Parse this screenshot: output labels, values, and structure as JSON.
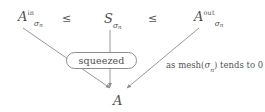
{
  "diagram": {
    "type": "squeeze-theorem-convergence",
    "top_row": {
      "left_term": {
        "base": "A",
        "superscript": "in",
        "subscript": "σ",
        "subsubscript": "n",
        "plain": "A_σn^in"
      },
      "middle_term": {
        "base": "S",
        "superscript": "",
        "subscript": "σ",
        "subsubscript": "n",
        "plain": "S_σn"
      },
      "right_term": {
        "base": "A",
        "superscript": "out",
        "subscript": "σ",
        "subsubscript": "n",
        "plain": "A_σn^out"
      },
      "relation_1": "≤",
      "relation_2": "≤"
    },
    "pill": {
      "label": "squeezed"
    },
    "annotation": {
      "prefix": "as mesh(",
      "symbol": "σ",
      "subscript": "n",
      "suffix": ") tends to 0",
      "plain": "as mesh(σn) tends to 0"
    },
    "target": {
      "label": "A"
    },
    "colors": {
      "ink": "#4f4f4f",
      "stroke": "#8d8d8d",
      "background": "#ffffff"
    }
  }
}
